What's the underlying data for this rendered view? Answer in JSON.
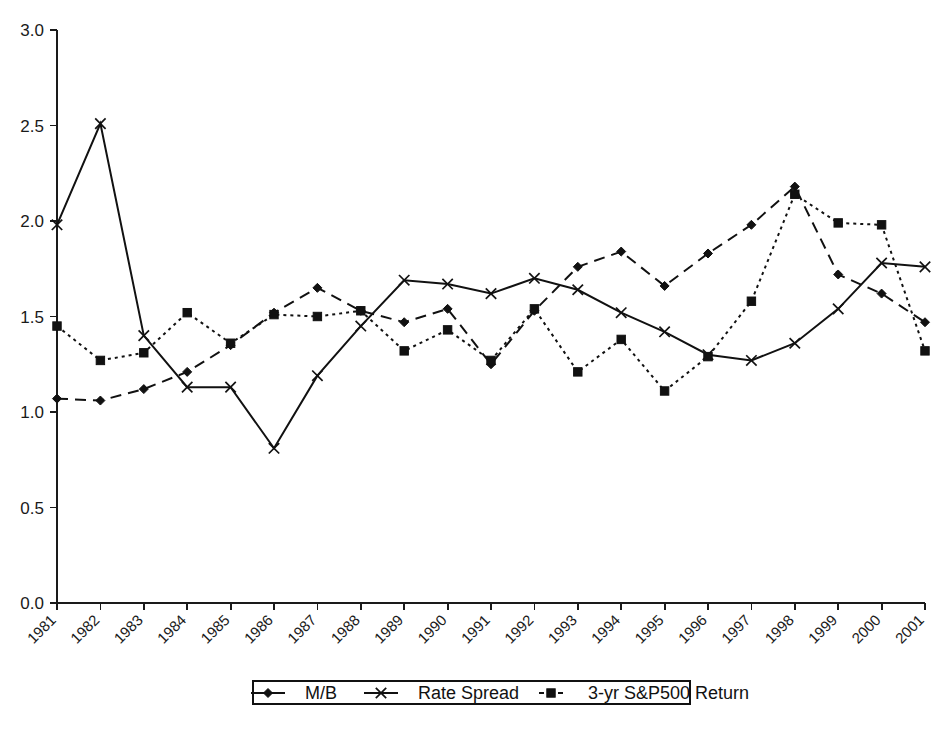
{
  "chart_data": {
    "type": "line",
    "title": "",
    "subtitle": "",
    "xlabel": "",
    "ylabel": "",
    "ylim": [
      0.0,
      3.0
    ],
    "ytick_labels": [
      "0.0",
      "0.5",
      "1.0",
      "1.5",
      "2.0",
      "2.5",
      "3.0"
    ],
    "ytick_values": [
      0.0,
      0.5,
      1.0,
      1.5,
      2.0,
      2.5,
      3.0
    ],
    "grid": false,
    "legend_position": "bottom",
    "categories": [
      "1981",
      "1982",
      "1983",
      "1984",
      "1985",
      "1986",
      "1987",
      "1988",
      "1989",
      "1990",
      "1991",
      "1992",
      "1993",
      "1994",
      "1995",
      "1996",
      "1997",
      "1998",
      "1999",
      "2000",
      "2001"
    ],
    "series": [
      {
        "name": "M/B",
        "marker": "diamond",
        "line_style": "dashed",
        "color": "#111111",
        "values": [
          1.07,
          1.06,
          1.12,
          1.21,
          1.35,
          1.52,
          1.65,
          1.53,
          1.47,
          1.54,
          1.25,
          1.53,
          1.76,
          1.84,
          1.66,
          1.83,
          1.98,
          2.18,
          1.72,
          1.62,
          1.47
        ]
      },
      {
        "name": "Rate Spread",
        "marker": "x",
        "line_style": "solid",
        "color": "#111111",
        "values": [
          1.98,
          2.51,
          1.4,
          1.13,
          1.13,
          0.81,
          1.19,
          1.45,
          1.69,
          1.67,
          1.62,
          1.7,
          1.64,
          1.52,
          1.42,
          1.3,
          1.27,
          1.36,
          1.54,
          1.78,
          1.76
        ]
      },
      {
        "name": "3-yr S&P500 Return",
        "marker": "square",
        "line_style": "dotted",
        "color": "#111111",
        "values": [
          1.45,
          1.27,
          1.31,
          1.52,
          1.36,
          1.51,
          1.5,
          1.53,
          1.32,
          1.43,
          1.27,
          1.54,
          1.21,
          1.38,
          1.11,
          1.29,
          1.58,
          2.14,
          1.99,
          1.98,
          1.32
        ]
      }
    ]
  },
  "axes": {
    "x_start_px": 57,
    "x_end_px": 925,
    "y_zero_px": 603,
    "y_top_px": 30
  },
  "legend": {
    "items": [
      {
        "label": "M/B",
        "marker": "diamond",
        "line_style": "solid"
      },
      {
        "label": "Rate Spread",
        "marker": "x",
        "line_style": "solid"
      },
      {
        "label": "3-yr S&P500 Return",
        "marker": "square",
        "line_style": "dotted"
      }
    ]
  }
}
